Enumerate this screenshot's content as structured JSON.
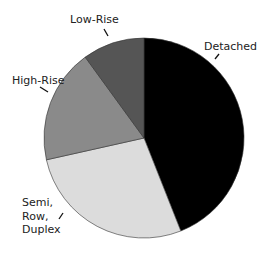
{
  "chart_data": {
    "type": "pie",
    "title": "",
    "start_angle_deg": 0,
    "direction": "clockwise",
    "categories": [
      "Detached",
      "Semi, Row, Duplex",
      "High-Rise",
      "Low-Rise"
    ],
    "values": [
      44,
      27.5,
      18.5,
      10
    ],
    "unit": "percent (estimated)",
    "colors": [
      "#000000",
      "#dcdcdc",
      "#8a8a8a",
      "#555555"
    ],
    "legend": "none (direct labels with leader ticks)",
    "labels": [
      {
        "text": "Detached",
        "x": 204,
        "y": 40,
        "tick": [
          215,
          59,
          219,
          54
        ]
      },
      {
        "text": "Semi,\nRow,\nDuplex",
        "x": 22,
        "y": 196,
        "tick": [
          59,
          219,
          63,
          213
        ]
      },
      {
        "text": "High-Rise",
        "x": 12,
        "y": 74,
        "tick": [
          40,
          87,
          48,
          92
        ]
      },
      {
        "text": "Low-Rise",
        "x": 70,
        "y": 13,
        "tick": [
          104,
          29,
          108,
          36
        ]
      }
    ]
  },
  "geometry": {
    "cx": 144,
    "cy": 138,
    "r": 100
  }
}
